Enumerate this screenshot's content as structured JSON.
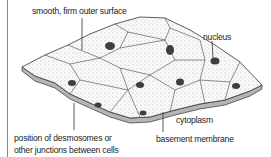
{
  "diagram": {
    "labels": {
      "surface": "smooth, firm outer surface",
      "nucleus": "nucleus",
      "cytoplasm": "cytoplasm",
      "basement": "basement membrane",
      "junctions_line1": "position of desmosomes or",
      "junctions_line2": "other junctions between cells"
    },
    "colors": {
      "outline": "#333333",
      "fill": "#f4f4f4",
      "nucleus": "#444444",
      "membrane": "#999999"
    }
  }
}
